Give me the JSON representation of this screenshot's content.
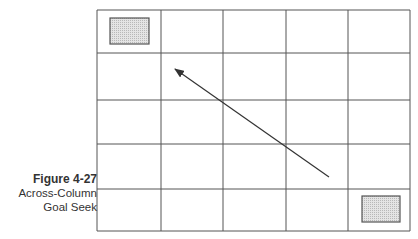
{
  "caption": {
    "figure_label": "Figure 4-27",
    "line1": "Across-Column",
    "line2": "Goal Seek"
  },
  "grid": {
    "columns": 5,
    "rows": 5,
    "col_edges": [
      97,
      161,
      223,
      286,
      348,
      410
    ],
    "row_edges": [
      10,
      53,
      100,
      144,
      189,
      231
    ],
    "line_color": "#555555"
  },
  "highlight_cells": [
    {
      "row": 0,
      "col": 0,
      "x": 110,
      "y": 18,
      "w": 39,
      "h": 26
    },
    {
      "row": 4,
      "col": 4,
      "x": 362,
      "y": 196,
      "w": 38,
      "h": 26
    }
  ],
  "arrow": {
    "from": [
      329,
      177
    ],
    "to": [
      175,
      69
    ],
    "color": "#333333"
  },
  "colors": {
    "cell_fill": "#d8d8d8",
    "cell_border": "#555555"
  }
}
